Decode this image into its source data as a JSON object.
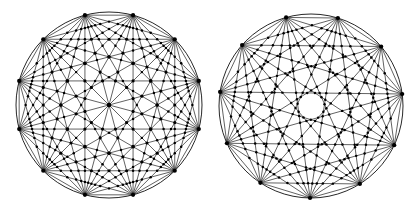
{
  "canvas": {
    "width": 417,
    "height": 211,
    "background_color": "#ffffff",
    "ink_color": "#000000"
  },
  "figure": {
    "kind": "chord-diagram-pair",
    "count": 2
  },
  "chart_data": {
    "type": "scatter",
    "title": "",
    "subtitle": "",
    "xlabel": "",
    "ylabel": "",
    "grid": false,
    "legend": null,
    "xlim": [
      0,
      417
    ],
    "ylim": [
      0,
      211
    ],
    "series": [
      {
        "name": "left-complete-graph",
        "label": "Complete graph on 12 boundary points",
        "vertex_count": 12,
        "edge_count": 66,
        "center_x": 109,
        "center_y": 105,
        "radius": 93,
        "start_angle_deg": 75,
        "boundary_ring": true,
        "vertex_radius_px": 2.1,
        "crossing_radius_px": 1.15,
        "line_width": 0.62,
        "color": "#000000",
        "vertex_angles_deg": [
          75,
          105,
          135,
          165,
          195,
          225,
          255,
          285,
          315,
          345,
          15,
          45
        ]
      },
      {
        "name": "right-complete-graph",
        "label": "Complete graph on 11 boundary points",
        "vertex_count": 11,
        "edge_count": 55,
        "center_x": 311,
        "center_y": 106,
        "radius": 92,
        "start_angle_deg": 73,
        "boundary_ring": true,
        "vertex_radius_px": 2.1,
        "crossing_radius_px": 1.15,
        "line_width": 0.62,
        "color": "#000000",
        "vertex_angles_deg": [
          73,
          105.7,
          138.5,
          171.2,
          203.9,
          236.6,
          269.4,
          302.1,
          334.8,
          7.5,
          40.3
        ]
      }
    ]
  }
}
